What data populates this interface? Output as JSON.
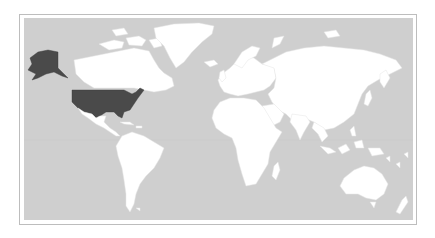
{
  "map": {
    "type": "world-choropleth",
    "projection": "equirectangular-like",
    "ocean_color": "#cfcfcf",
    "land_color": "#ffffff",
    "highlight_color": "#4a4a4a",
    "highlighted_regions": [
      {
        "name": "United States",
        "includes": [
          "Contiguous USA",
          "Alaska"
        ]
      }
    ],
    "labels": []
  }
}
